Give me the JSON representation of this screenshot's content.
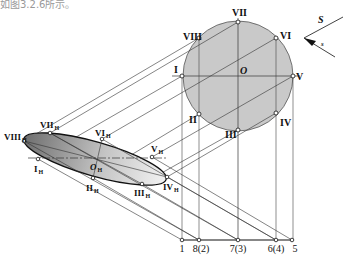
{
  "header_fragment": "如图3.2.6所示。",
  "circle": {
    "center_label": "O",
    "points": [
      {
        "label": "I",
        "x": 182,
        "y": 75
      },
      {
        "label": "II",
        "x": 199,
        "y": 114
      },
      {
        "label": "III",
        "x": 238,
        "y": 130
      },
      {
        "label": "IV",
        "x": 276,
        "y": 113
      },
      {
        "label": "V",
        "x": 293,
        "y": 76
      },
      {
        "label": "VI",
        "x": 276,
        "y": 38
      },
      {
        "label": "VII",
        "x": 238,
        "y": 22
      },
      {
        "label": "VIII",
        "x": 199,
        "y": 38
      }
    ],
    "fill": "#c8c8c8"
  },
  "ellipse": {
    "center_label": "O",
    "center_sub": "H",
    "points": [
      {
        "label": "I",
        "sub": "H",
        "x": 38,
        "y": 159
      },
      {
        "label": "II",
        "sub": "H",
        "x": 93,
        "y": 178
      },
      {
        "label": "III",
        "sub": "H",
        "x": 142,
        "y": 184
      },
      {
        "label": "IV",
        "sub": "H",
        "x": 167,
        "y": 177
      },
      {
        "label": "V",
        "sub": "H",
        "x": 152,
        "y": 157
      },
      {
        "label": "VI",
        "sub": "H",
        "x": 102,
        "y": 139
      },
      {
        "label": "VII",
        "sub": "H",
        "x": 50,
        "y": 133
      },
      {
        "label": "VIII",
        "sub": "H",
        "x": 24,
        "y": 141
      }
    ]
  },
  "baseline": {
    "points": [
      {
        "label": "1",
        "x": 182
      },
      {
        "label": "8(2)",
        "x": 199
      },
      {
        "label": "7(3)",
        "x": 238
      },
      {
        "label": "6(4)",
        "x": 276
      },
      {
        "label": "5",
        "x": 292
      }
    ]
  },
  "direction": {
    "S_label": "S",
    "s_label": "s"
  }
}
